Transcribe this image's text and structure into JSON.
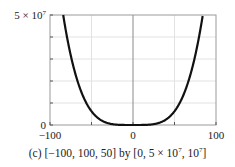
{
  "chart_data": {
    "type": "line",
    "function": "y = x^4",
    "title": "",
    "caption": {
      "prefix": "(c) [−100, 100, 50] by [0, 5 × 10",
      "mid": ", 10",
      "suffix": "]",
      "exp": "7"
    },
    "xlabel": "",
    "ylabel": "",
    "xlim": [
      -100,
      100
    ],
    "ylim": [
      0,
      50000000
    ],
    "xscale": 50,
    "yscale": 10000000,
    "x_tick_labels": [
      "−100",
      "0",
      "100"
    ],
    "y_tick_labels": {
      "top_base": "5 × 10",
      "top_exp": "7",
      "bottom": "0"
    },
    "grid": true,
    "series": [
      {
        "name": "x^4",
        "color": "#111111",
        "x": [
          -84.1,
          -80,
          -75,
          -70,
          -65,
          -60,
          -55,
          -50,
          -45,
          -40,
          -35,
          -30,
          -25,
          -20,
          -10,
          0,
          10,
          20,
          25,
          30,
          35,
          40,
          45,
          50,
          55,
          60,
          65,
          70,
          75,
          80,
          84.1
        ],
        "values": [
          50000000,
          40960000,
          31640625,
          24010000,
          17850625,
          12960000,
          9150625,
          6250000,
          4100625,
          2560000,
          1500625,
          810000,
          390625,
          160000,
          10000,
          0,
          10000,
          160000,
          390625,
          810000,
          1500625,
          2560000,
          4100625,
          6250000,
          9150625,
          12960000,
          17850625,
          24010000,
          31640625,
          40960000,
          50000000
        ]
      }
    ]
  },
  "colors": {
    "frame": "#9a9a9a",
    "grid": "#e2e2e2",
    "axis": "#8a8a8a",
    "curve": "#111111"
  }
}
